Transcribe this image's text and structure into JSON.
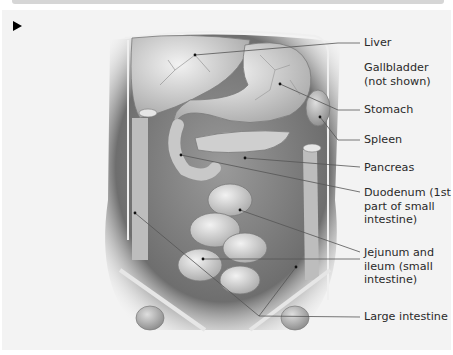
{
  "figure": {
    "marker_icon": "play-triangle-icon",
    "labels": [
      {
        "id": "liver",
        "text": "Liver"
      },
      {
        "id": "gallbladder",
        "text": "Gallbladder\n(not shown)"
      },
      {
        "id": "stomach",
        "text": "Stomach"
      },
      {
        "id": "spleen",
        "text": "Spleen"
      },
      {
        "id": "pancreas",
        "text": "Pancreas"
      },
      {
        "id": "duodenum",
        "text": "Duodenum (1st\npart of small\nintestine)"
      },
      {
        "id": "jejunum-ileum",
        "text": "Jejunum and\nileum (small\nintestine)"
      },
      {
        "id": "large-intestine",
        "text": "Large intestine"
      }
    ]
  },
  "colors": {
    "panel_bg": "#f3f3f3",
    "leader_line": "#555555",
    "organ_light": "#dcdcdc",
    "organ_dark": "#6e6e6e"
  }
}
